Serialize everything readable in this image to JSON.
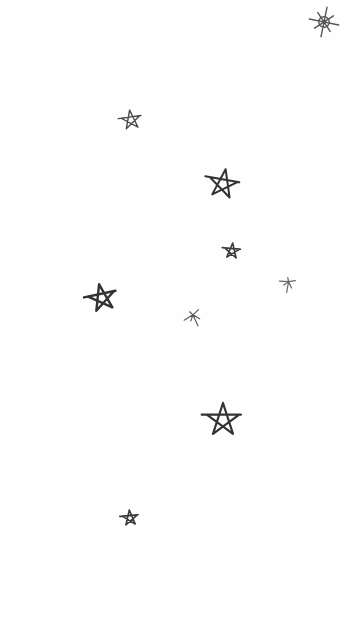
{
  "canvas": {
    "background": "#fefefe",
    "stroke_color": "#3a3a3a"
  },
  "stars": [
    {
      "name": "star-sparkle-top-right",
      "type": "sparkle",
      "x": 324,
      "y": 22,
      "size": 30,
      "stroke": 1.4,
      "color": "#555555",
      "rotate": 0
    },
    {
      "name": "star-1",
      "type": "pentagram",
      "x": 131,
      "y": 120,
      "size": 20,
      "stroke": 1.4,
      "color": "#4a4a4a",
      "rotate": -8
    },
    {
      "name": "star-2",
      "type": "pentagram",
      "x": 223,
      "y": 184,
      "size": 30,
      "stroke": 2.0,
      "color": "#333333",
      "rotate": 10
    },
    {
      "name": "star-3",
      "type": "pentagram",
      "x": 232,
      "y": 251,
      "size": 16,
      "stroke": 1.6,
      "color": "#3d3d3d",
      "rotate": 5
    },
    {
      "name": "star-4",
      "type": "sketch",
      "x": 287,
      "y": 284,
      "size": 18,
      "stroke": 1.2,
      "color": "#666666",
      "rotate": 15
    },
    {
      "name": "star-5",
      "type": "pentagram",
      "x": 102,
      "y": 298,
      "size": 28,
      "stroke": 2.4,
      "color": "#333333",
      "rotate": -12
    },
    {
      "name": "star-6",
      "type": "sketch",
      "x": 193,
      "y": 318,
      "size": 20,
      "stroke": 1.2,
      "color": "#5a5a5a",
      "rotate": -20
    },
    {
      "name": "star-7",
      "type": "pentagram",
      "x": 223,
      "y": 420,
      "size": 34,
      "stroke": 2.2,
      "color": "#333333",
      "rotate": 0
    },
    {
      "name": "star-8",
      "type": "pentagram",
      "x": 130,
      "y": 518,
      "size": 16,
      "stroke": 1.6,
      "color": "#3a3a3a",
      "rotate": -5
    }
  ]
}
